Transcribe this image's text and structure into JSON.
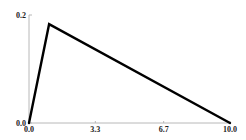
{
  "chart_data": {
    "type": "line",
    "title": "",
    "xlabel": "",
    "ylabel": "",
    "xlim": [
      0.0,
      10.0
    ],
    "ylim": [
      0.0,
      0.2
    ],
    "xticks": [
      0.0,
      3.3,
      6.7,
      10.0
    ],
    "xtick_labels": [
      "0.0",
      "3.3",
      "6.7",
      "10.0"
    ],
    "yticks": [
      0.0,
      0.2
    ],
    "ytick_labels": [
      "0.0",
      "0.2"
    ],
    "grid": false,
    "legend": null,
    "series": [
      {
        "name": "triangular density",
        "color": "#000000",
        "x": [
          0.0,
          1.0,
          10.0
        ],
        "y": [
          0.0,
          0.183,
          0.0
        ]
      }
    ]
  }
}
